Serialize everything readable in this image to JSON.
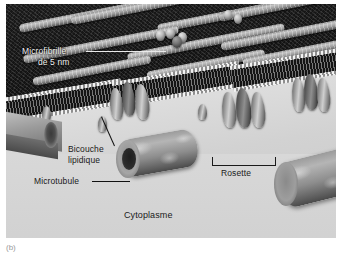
{
  "figure": {
    "caption_marker": "(b)"
  },
  "labels": {
    "microfibril": {
      "line1": "Microfibrille",
      "line2": "de 5 nm",
      "name": "microfibril-label"
    },
    "bilayer": {
      "line1": "Bicouche",
      "line2": "lipidique",
      "name": "lipid-bilayer-label"
    },
    "microtubule": {
      "text": "Microtubule",
      "name": "microtubule-label"
    },
    "rosette": {
      "text": "Rosette",
      "name": "rosette-label"
    },
    "cytoplasm": {
      "text": "Cytoplasme",
      "name": "cytoplasm-label"
    }
  },
  "colors": {
    "cell_wall_dark": "#141414",
    "cytoplasm_light": "#d6d6d6",
    "membrane_head": "#f2f2f2",
    "label_text": "#1a1a1a",
    "label_text_light": "#f2f2f2",
    "page_background": "#ffffff"
  }
}
